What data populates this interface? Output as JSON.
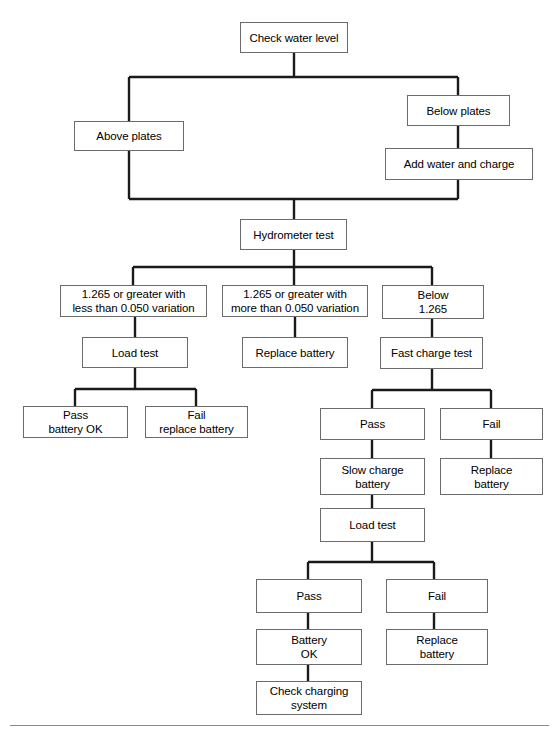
{
  "diagram": {
    "canvas": {
      "width": 559,
      "height": 737
    },
    "style": {
      "box_border_color": "#6b6b6b",
      "box_fill_color": "#ffffff",
      "wire_color": "#1a1a1a",
      "rule_color": "#8a8a8a",
      "text_color": "#000000"
    },
    "nodes": [
      {
        "id": "check-water-level",
        "label": "Check water level",
        "x": 240,
        "y": 22,
        "w": 108,
        "h": 31
      },
      {
        "id": "above-plates",
        "label": "Above plates",
        "x": 74,
        "y": 121,
        "w": 110,
        "h": 30
      },
      {
        "id": "below-plates",
        "label": "Below plates",
        "x": 407,
        "y": 95,
        "w": 103,
        "h": 31
      },
      {
        "id": "add-water-and-charge",
        "label": "Add water and charge",
        "x": 385,
        "y": 148,
        "w": 148,
        "h": 32
      },
      {
        "id": "hydrometer-test",
        "label": "Hydrometer test",
        "x": 240,
        "y": 219,
        "w": 107,
        "h": 31
      },
      {
        "id": "reading-less-variation",
        "label": "1.265 or greater with\nless than 0.050 variation",
        "x": 60,
        "y": 285,
        "w": 147,
        "h": 32
      },
      {
        "id": "reading-more-variation",
        "label": "1.265 or greater with\nmore than 0.050 variation",
        "x": 222,
        "y": 285,
        "w": 146,
        "h": 32
      },
      {
        "id": "reading-below-1265",
        "label": "Below\n1.265",
        "x": 382,
        "y": 285,
        "w": 102,
        "h": 34
      },
      {
        "id": "load-test-1",
        "label": "Load test",
        "x": 82,
        "y": 337,
        "w": 106,
        "h": 31
      },
      {
        "id": "replace-battery-1",
        "label": "Replace battery",
        "x": 242,
        "y": 337,
        "w": 106,
        "h": 31
      },
      {
        "id": "fast-charge-test",
        "label": "Fast charge test",
        "x": 380,
        "y": 337,
        "w": 103,
        "h": 32
      },
      {
        "id": "pass-battery-ok",
        "label": "Pass\nbattery OK",
        "x": 23,
        "y": 406,
        "w": 105,
        "h": 32
      },
      {
        "id": "fail-replace-battery",
        "label": "Fail\nreplace battery",
        "x": 145,
        "y": 406,
        "w": 103,
        "h": 32
      },
      {
        "id": "fast-charge-pass",
        "label": "Pass",
        "x": 320,
        "y": 408,
        "w": 105,
        "h": 32
      },
      {
        "id": "fast-charge-fail",
        "label": "Fail",
        "x": 440,
        "y": 408,
        "w": 103,
        "h": 32
      },
      {
        "id": "slow-charge-battery",
        "label": "Slow charge\nbattery",
        "x": 320,
        "y": 458,
        "w": 105,
        "h": 37
      },
      {
        "id": "replace-battery-2",
        "label": "Replace\nbattery",
        "x": 440,
        "y": 458,
        "w": 103,
        "h": 37
      },
      {
        "id": "load-test-2",
        "label": "Load test",
        "x": 320,
        "y": 508,
        "w": 105,
        "h": 34
      },
      {
        "id": "load-test-2-pass",
        "label": "Pass",
        "x": 256,
        "y": 579,
        "w": 106,
        "h": 34
      },
      {
        "id": "load-test-2-fail",
        "label": "Fail",
        "x": 386,
        "y": 579,
        "w": 102,
        "h": 34
      },
      {
        "id": "battery-ok",
        "label": "Battery\nOK",
        "x": 256,
        "y": 629,
        "w": 106,
        "h": 36
      },
      {
        "id": "replace-battery-3",
        "label": "Replace\nbattery",
        "x": 386,
        "y": 629,
        "w": 102,
        "h": 36
      },
      {
        "id": "check-charging-system",
        "label": "Check charging\nsystem",
        "x": 256,
        "y": 681,
        "w": 106,
        "h": 34
      }
    ],
    "wires": [
      {
        "id": "w-check-to-bus",
        "from": "check-water-level",
        "to": "split-bus-top",
        "d": "M 294 53 L 294 77"
      },
      {
        "id": "w-bus-top",
        "from": "split-bus-top",
        "to": "branch-ends",
        "d": "M 129 77 L 458 77"
      },
      {
        "id": "w-bus-left-down",
        "from": "split-bus-top",
        "to": "above-plates",
        "d": "M 129 77 L 129 121"
      },
      {
        "id": "w-bus-right-down",
        "from": "split-bus-top",
        "to": "below-plates",
        "d": "M 458 77 L 458 95"
      },
      {
        "id": "w-below-to-addwater",
        "from": "below-plates",
        "to": "add-water-and-charge",
        "d": "M 458 126 L 458 148"
      },
      {
        "id": "w-above-to-merge",
        "from": "above-plates",
        "to": "merge-bus",
        "d": "M 129 151 L 129 199"
      },
      {
        "id": "w-addwater-to-merge",
        "from": "add-water-and-charge",
        "to": "merge-bus",
        "d": "M 458 180 L 458 199"
      },
      {
        "id": "w-merge-bus",
        "from": "merge-bus",
        "to": "merge-bus",
        "d": "M 129 199 L 458 199"
      },
      {
        "id": "w-merge-to-hydrometer",
        "from": "merge-bus",
        "to": "hydrometer-test",
        "d": "M 294 199 L 294 219"
      },
      {
        "id": "w-hydro-to-bus",
        "from": "hydrometer-test",
        "to": "hydro-bus",
        "d": "M 294 250 L 294 267"
      },
      {
        "id": "w-hydro-bus",
        "from": "hydro-bus",
        "to": "hydro-bus",
        "d": "M 133 267 L 432 267"
      },
      {
        "id": "w-hydro-b1",
        "from": "hydro-bus",
        "to": "reading-less-variation",
        "d": "M 133 267 L 133 285"
      },
      {
        "id": "w-hydro-b2",
        "from": "hydro-bus",
        "to": "reading-more-variation",
        "d": "M 294 267 L 294 285"
      },
      {
        "id": "w-hydro-b3",
        "from": "hydro-bus",
        "to": "reading-below-1265",
        "d": "M 432 267 L 432 285"
      },
      {
        "id": "w-b1-to-loadtest",
        "from": "reading-less-variation",
        "to": "load-test-1",
        "d": "M 135 317 L 135 337"
      },
      {
        "id": "w-b2-to-replace",
        "from": "reading-more-variation",
        "to": "replace-battery-1",
        "d": "M 295 317 L 295 337"
      },
      {
        "id": "w-b3-to-fastcharge",
        "from": "reading-below-1265",
        "to": "fast-charge-test",
        "d": "M 432 319 L 432 337"
      },
      {
        "id": "w-loadtest1-down",
        "from": "load-test-1",
        "to": "loadtest1-bus",
        "d": "M 135 368 L 135 389"
      },
      {
        "id": "w-loadtest1-bus",
        "from": "loadtest1-bus",
        "to": "loadtest1-bus",
        "d": "M 75 389 L 196 389"
      },
      {
        "id": "w-loadtest1-pass",
        "from": "loadtest1-bus",
        "to": "pass-battery-ok",
        "d": "M 75 389 L 75 406"
      },
      {
        "id": "w-loadtest1-fail",
        "from": "loadtest1-bus",
        "to": "fail-replace-battery",
        "d": "M 196 389 L 196 406"
      },
      {
        "id": "w-fastcharge-down",
        "from": "fast-charge-test",
        "to": "fastcharge-bus",
        "d": "M 432 369 L 432 390"
      },
      {
        "id": "w-fastcharge-bus",
        "from": "fastcharge-bus",
        "to": "fastcharge-bus",
        "d": "M 372 390 L 491 390"
      },
      {
        "id": "w-fastcharge-pass",
        "from": "fastcharge-bus",
        "to": "fast-charge-pass",
        "d": "M 372 390 L 372 408"
      },
      {
        "id": "w-fastcharge-fail",
        "from": "fastcharge-bus",
        "to": "fast-charge-fail",
        "d": "M 491 390 L 491 408"
      },
      {
        "id": "w-pass-to-slowcharge",
        "from": "fast-charge-pass",
        "to": "slow-charge-battery",
        "d": "M 372 440 L 372 458"
      },
      {
        "id": "w-fail-to-replace2",
        "from": "fast-charge-fail",
        "to": "replace-battery-2",
        "d": "M 491 440 L 491 458"
      },
      {
        "id": "w-slow-to-loadtest2",
        "from": "slow-charge-battery",
        "to": "load-test-2",
        "d": "M 372 495 L 372 508"
      },
      {
        "id": "w-loadtest2-down",
        "from": "load-test-2",
        "to": "loadtest2-bus",
        "d": "M 372 542 L 372 562"
      },
      {
        "id": "w-loadtest2-bus",
        "from": "loadtest2-bus",
        "to": "loadtest2-bus",
        "d": "M 308 562 L 434 562"
      },
      {
        "id": "w-loadtest2-pass",
        "from": "loadtest2-bus",
        "to": "load-test-2-pass",
        "d": "M 308 562 L 308 579"
      },
      {
        "id": "w-loadtest2-fail",
        "from": "loadtest2-bus",
        "to": "load-test-2-fail",
        "d": "M 434 562 L 434 579"
      },
      {
        "id": "w-pass2-to-batteryok",
        "from": "load-test-2-pass",
        "to": "battery-ok",
        "d": "M 308 613 L 308 629"
      },
      {
        "id": "w-fail2-to-replace3",
        "from": "load-test-2-fail",
        "to": "replace-battery-3",
        "d": "M 434 613 L 434 629"
      },
      {
        "id": "w-batteryok-to-charging",
        "from": "battery-ok",
        "to": "check-charging-system",
        "d": "M 308 665 L 308 681"
      }
    ],
    "rules": [
      {
        "id": "bottom-rule",
        "x": 10,
        "y": 725,
        "w": 539
      }
    ]
  }
}
